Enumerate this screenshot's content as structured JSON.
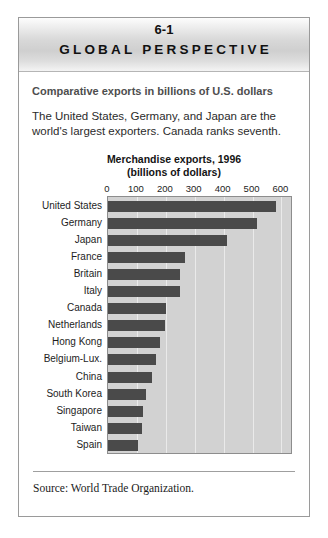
{
  "figure": {
    "number": "6-1",
    "banner_title": "GLOBAL PERSPECTIVE",
    "subtitle": "Comparative exports in billions of U.S. dollars",
    "lede": "The United States, Germany, and Japan are the world's largest exporters. Canada ranks seventh.",
    "source": "Source: World Trade Organization."
  },
  "chart_data": {
    "type": "bar",
    "orientation": "horizontal",
    "title": "Merchandise exports, 1996",
    "subtitle": "(billions of dollars)",
    "xlabel": "",
    "ylabel": "",
    "xlim": [
      0,
      640
    ],
    "xticks": [
      0,
      100,
      200,
      300,
      400,
      500,
      600
    ],
    "xtick_labels": [
      "0",
      "100",
      "200",
      "300",
      "400",
      "500",
      "600"
    ],
    "grid": true,
    "legend": false,
    "categories": [
      "United States",
      "Germany",
      "Japan",
      "France",
      "Britain",
      "Italy",
      "Canada",
      "Netherlands",
      "Hong Kong",
      "Belgium-Lux.",
      "China",
      "South Korea",
      "Singapore",
      "Taiwan",
      "Spain"
    ],
    "values": [
      582,
      516,
      411,
      268,
      250,
      248,
      200,
      197,
      181,
      166,
      151,
      130,
      120,
      116,
      105
    ],
    "bar_color": "#4a4a4a",
    "plot_background": "#d2d2d2"
  }
}
